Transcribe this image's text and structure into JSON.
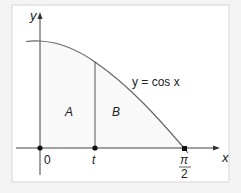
{
  "diagram": {
    "axes": {
      "x_label": "x",
      "y_label": "y"
    },
    "curve_label": "y = cos x",
    "regions": [
      {
        "label": "A"
      },
      {
        "label": "B"
      }
    ],
    "ticks": {
      "origin": "0",
      "t": "t",
      "pi_num": "π",
      "pi_den": "2"
    },
    "colors": {
      "background": "#f4f4f4",
      "panel": "#ffffff",
      "border": "#d0d0d0",
      "line": "#555555",
      "fill": "#fafafa"
    }
  }
}
